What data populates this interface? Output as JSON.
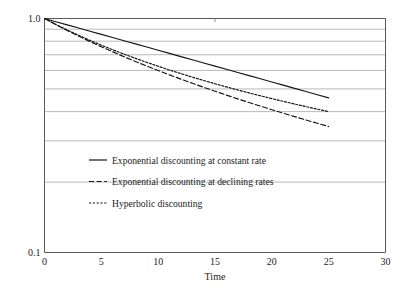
{
  "chart_data": {
    "type": "line",
    "title": "",
    "subtitle": "",
    "xlabel": "Time",
    "ylabel": "",
    "xlim": [
      0,
      30
    ],
    "ylim": [
      0.1,
      1.0
    ],
    "yscale": "log",
    "xscale": "linear",
    "grid": {
      "horizontal": true,
      "vertical": false,
      "color": "#9a9a9a"
    },
    "legend": {
      "position": "inside-center-left",
      "entries": [
        {
          "label": "Exponential discounting at constant rate",
          "style": "solid"
        },
        {
          "label": "Exponential discounting at declining rates",
          "style": "dashed"
        },
        {
          "label": "Hyperbolic discounting",
          "style": "finely-dashed"
        }
      ]
    },
    "xticks": [
      {
        "value": 0,
        "label": "0"
      },
      {
        "value": 5,
        "label": "5"
      },
      {
        "value": 10,
        "label": "10"
      },
      {
        "value": 15,
        "label": "15"
      },
      {
        "value": 20,
        "label": "20"
      },
      {
        "value": 25,
        "label": "25"
      },
      {
        "value": 30,
        "label": "30"
      }
    ],
    "yticks": [
      {
        "value": 1.0,
        "label": "1.0"
      },
      {
        "value": 0.1,
        "label": "0.1"
      }
    ],
    "ygridlines": [
      0.9,
      0.8,
      0.7,
      0.6,
      0.5,
      0.4,
      0.3,
      0.2
    ],
    "series": [
      {
        "name": "Exponential discounting at constant rate",
        "style": "solid",
        "color": "#141414",
        "x": [
          0,
          1,
          2,
          3,
          4,
          5,
          6,
          7,
          8,
          9,
          10,
          11,
          12,
          13,
          14,
          15,
          16,
          17,
          18,
          19,
          20,
          21,
          22,
          23,
          24,
          25
        ],
        "y": [
          1.0,
          0.9692,
          0.9394,
          0.9105,
          0.8825,
          0.8554,
          0.8291,
          0.8036,
          0.7789,
          0.7549,
          0.7317,
          0.7092,
          0.6874,
          0.6663,
          0.6458,
          0.6259,
          0.6067,
          0.588,
          0.5699,
          0.5524,
          0.5354,
          0.5189,
          0.5029,
          0.4875,
          0.4725,
          0.4579
        ]
      },
      {
        "name": "Exponential discounting at declining rates",
        "style": "dashed",
        "color": "#141414",
        "x": [
          0,
          1,
          2,
          3,
          4,
          5,
          6,
          7,
          8,
          9,
          10,
          11,
          12,
          13,
          14,
          15,
          16,
          17,
          18,
          19,
          20,
          21,
          22,
          23,
          24,
          25
        ],
        "y": [
          1.0,
          0.9418,
          0.889,
          0.841,
          0.7972,
          0.7571,
          0.7203,
          0.6864,
          0.6551,
          0.6261,
          0.5992,
          0.5741,
          0.5507,
          0.5288,
          0.5082,
          0.4889,
          0.4707,
          0.4536,
          0.4374,
          0.4221,
          0.4076,
          0.3939,
          0.3808,
          0.3684,
          0.3566,
          0.3453
        ]
      },
      {
        "name": "Hyperbolic discounting",
        "style": "finely-dashed",
        "color": "#141414",
        "x": [
          0,
          1,
          2,
          3,
          4,
          5,
          6,
          7,
          8,
          9,
          10,
          11,
          12,
          13,
          14,
          15,
          16,
          17,
          18,
          19,
          20,
          21,
          22,
          23,
          24,
          25
        ],
        "y": [
          1.0,
          0.9434,
          0.8929,
          0.8475,
          0.8065,
          0.7692,
          0.7353,
          0.7042,
          0.6757,
          0.6494,
          0.625,
          0.6024,
          0.5814,
          0.5618,
          0.5435,
          0.5263,
          0.5102,
          0.495,
          0.4808,
          0.4673,
          0.4545,
          0.4425,
          0.431,
          0.4202,
          0.4098,
          0.4
        ]
      }
    ]
  }
}
